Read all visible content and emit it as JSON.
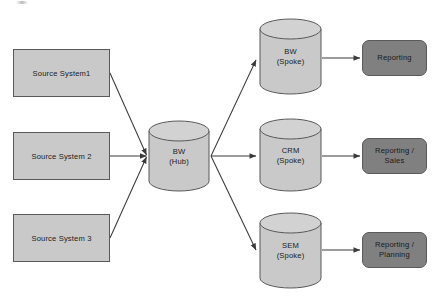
{
  "diagram": {
    "colors": {
      "source_fill": "#c9c9c9",
      "cylinder_fill": "#c9c9c9",
      "cylinder_top_fill": "#d2d2d2",
      "output_fill": "#808080",
      "stroke": "#595959",
      "background": "#ffffff"
    },
    "sources": [
      {
        "id": "source-system-1",
        "label": "Source System1"
      },
      {
        "id": "source-system-2",
        "label": "Source System 2"
      },
      {
        "id": "source-system-3",
        "label": "Source System 3"
      }
    ],
    "hub": {
      "id": "bw-hub",
      "line1": "BW",
      "line2": "(Hub)",
      "shape": "cylinder"
    },
    "spokes": [
      {
        "id": "bw-spoke",
        "line1": "BW",
        "line2": "(Spoke)",
        "shape": "cylinder"
      },
      {
        "id": "crm-spoke",
        "line1": "CRM",
        "line2": "(Spoke)",
        "shape": "cylinder"
      },
      {
        "id": "sem-spoke",
        "line1": "SEM",
        "line2": "(Spoke)",
        "shape": "cylinder"
      }
    ],
    "outputs": [
      {
        "id": "reporting",
        "line1": "Reporting",
        "line2": ""
      },
      {
        "id": "reporting-sales",
        "line1": "Reporting /",
        "line2": "Sales"
      },
      {
        "id": "reporting-planning",
        "line1": "Reporting /",
        "line2": "Planning"
      }
    ],
    "connections": [
      {
        "from": "source-system-1",
        "to": "bw-hub",
        "arrow": "end"
      },
      {
        "from": "source-system-2",
        "to": "bw-hub",
        "arrow": "end"
      },
      {
        "from": "source-system-3",
        "to": "bw-hub",
        "arrow": "end"
      },
      {
        "from": "bw-hub",
        "to": "bw-spoke",
        "arrow": "end"
      },
      {
        "from": "bw-hub",
        "to": "crm-spoke",
        "arrow": "end"
      },
      {
        "from": "bw-hub",
        "to": "sem-spoke",
        "arrow": "end"
      },
      {
        "from": "bw-spoke",
        "to": "reporting",
        "arrow": "end"
      },
      {
        "from": "crm-spoke",
        "to": "reporting-sales",
        "arrow": "end"
      },
      {
        "from": "sem-spoke",
        "to": "reporting-planning",
        "arrow": "end"
      }
    ]
  }
}
